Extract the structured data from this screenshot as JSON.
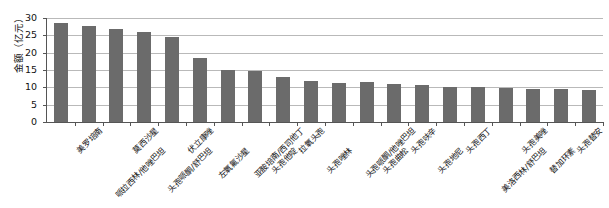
{
  "chart_data": {
    "type": "bar",
    "title": "",
    "xlabel": "",
    "ylabel": "金额（亿元）",
    "ylim": [
      0,
      30
    ],
    "yticks": [
      0,
      5,
      10,
      15,
      20,
      25,
      30
    ],
    "grid": true,
    "legend": "none",
    "bar_color": "#6b6b6b",
    "axis_color": "#555555",
    "grid_color": "#b9b9b9",
    "categories": [
      "美罗培南",
      "哌拉西林/他唑巴坦",
      "莫西沙星",
      "头孢哌酮/舒巴坦",
      "伏立康唑",
      "左氧氟沙星",
      "亚胺培南/西司他丁",
      "头孢他啶",
      "拉氧头孢",
      "头孢唑林",
      "头孢哌酮/他唑巴坦",
      "头孢曲松",
      "头孢呋辛",
      "头孢地尼",
      "头孢西丁",
      "美洛西林/舒巴坦",
      "头孢美唑",
      "替加环素",
      "头孢替安",
      "哌拉西林/舒巴坦"
    ],
    "values": [
      28.5,
      27.7,
      26.7,
      26.1,
      24.6,
      18.4,
      14.9,
      14.8,
      13.1,
      11.8,
      11.2,
      11.4,
      11.0,
      10.7,
      10.2,
      10.1,
      9.8,
      9.5,
      9.4,
      9.1
    ]
  }
}
